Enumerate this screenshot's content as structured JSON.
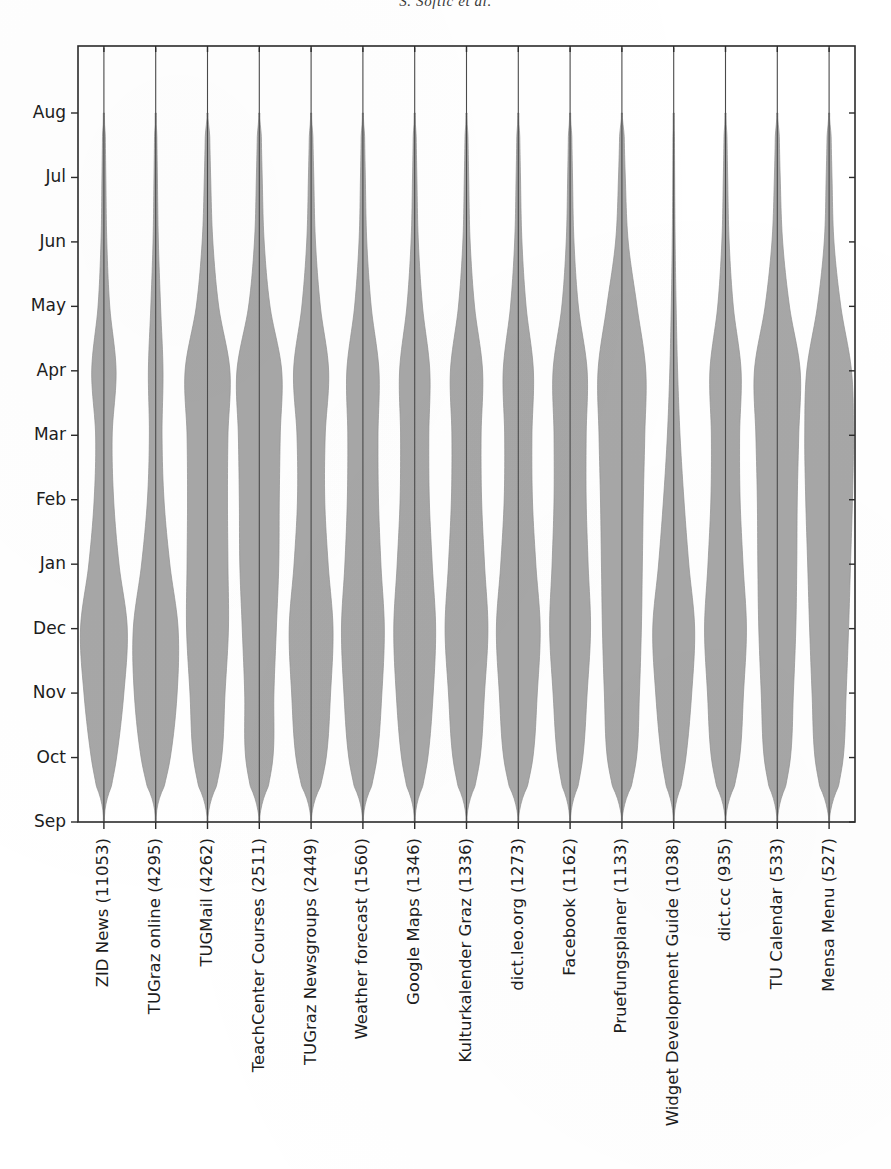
{
  "page": {
    "running_header": "S. Softic et al.",
    "folio": ""
  },
  "chart_data": {
    "type": "violin",
    "title": "",
    "xlabel": "",
    "ylabel": "",
    "orientation": "vertical",
    "grid": false,
    "legend": null,
    "y_axis": {
      "tick_labels": [
        "Aug",
        "Jul",
        "Jun",
        "May",
        "Apr",
        "Mar",
        "Feb",
        "Jan",
        "Dec",
        "Nov",
        "Oct",
        "Sep"
      ],
      "order": "top-to-bottom",
      "range_top": "Aug",
      "range_bottom": "Sep"
    },
    "categories": [
      "ZID News (11053)",
      "TUGraz online (4295)",
      "TUGMail (4262)",
      "TeachCenter Courses (2511)",
      "TUGraz Newsgroups (2449)",
      "Weather forecast (1560)",
      "Google Maps (1346)",
      "Kulturkalender Graz (1336)",
      "dict.leo.org (1273)",
      "Facebook (1162)",
      "Pruefungsplaner (1133)",
      "Widget Development Guide (1038)",
      "dict.cc (935)",
      "TU Calendar (533)",
      "Mensa Menu (527)"
    ],
    "counts": [
      11053,
      4295,
      4262,
      2511,
      2449,
      1560,
      1346,
      1336,
      1273,
      1162,
      1133,
      1038,
      935,
      533,
      527
    ],
    "series": [
      {
        "name": "ZID News (11053)",
        "count": 11053,
        "density_months": [
          "Sep",
          "Oct",
          "Nov",
          "Dec",
          "Jan",
          "Feb",
          "Mar",
          "Apr",
          "May",
          "Jun",
          "Jul",
          "Aug"
        ],
        "density": [
          0.07,
          0.52,
          0.82,
          0.96,
          0.62,
          0.4,
          0.34,
          0.5,
          0.24,
          0.12,
          0.08,
          0.05
        ]
      },
      {
        "name": "TUGraz online (4295)",
        "count": 4295,
        "density": [
          0.06,
          0.6,
          0.88,
          0.92,
          0.58,
          0.34,
          0.26,
          0.3,
          0.2,
          0.11,
          0.07,
          0.04
        ]
      },
      {
        "name": "TUGMail (4262)",
        "count": 4262,
        "density": [
          0.1,
          0.58,
          0.72,
          0.86,
          0.84,
          0.82,
          0.84,
          0.92,
          0.46,
          0.22,
          0.13,
          0.08
        ]
      },
      {
        "name": "TeachCenter Courses (2511)",
        "count": 2511,
        "density": [
          0.12,
          0.56,
          0.6,
          0.7,
          0.8,
          0.82,
          0.86,
          0.92,
          0.44,
          0.2,
          0.12,
          0.07
        ]
      },
      {
        "name": "TUGraz Newsgroups (2449)",
        "count": 2449,
        "density": [
          0.1,
          0.62,
          0.8,
          0.9,
          0.7,
          0.56,
          0.58,
          0.72,
          0.38,
          0.18,
          0.11,
          0.06
        ]
      },
      {
        "name": "Weather forecast (1560)",
        "count": 1560,
        "density": [
          0.09,
          0.58,
          0.78,
          0.88,
          0.74,
          0.64,
          0.62,
          0.66,
          0.34,
          0.16,
          0.1,
          0.06
        ]
      },
      {
        "name": "Google Maps (1346)",
        "count": 1346,
        "density": [
          0.08,
          0.54,
          0.76,
          0.86,
          0.72,
          0.6,
          0.58,
          0.62,
          0.32,
          0.15,
          0.09,
          0.05
        ]
      },
      {
        "name": "Kulturkalender Graz (1336)",
        "count": 1336,
        "density": [
          0.09,
          0.56,
          0.74,
          0.88,
          0.74,
          0.62,
          0.6,
          0.66,
          0.33,
          0.15,
          0.09,
          0.05
        ]
      },
      {
        "name": "dict.leo.org (1273)",
        "count": 1273,
        "density": [
          0.1,
          0.6,
          0.78,
          0.9,
          0.72,
          0.58,
          0.56,
          0.62,
          0.32,
          0.15,
          0.09,
          0.05
        ]
      },
      {
        "name": "Facebook (1162)",
        "count": 1162,
        "density": [
          0.09,
          0.52,
          0.7,
          0.84,
          0.74,
          0.66,
          0.66,
          0.7,
          0.34,
          0.16,
          0.1,
          0.06
        ]
      },
      {
        "name": "Pruefungsplaner (1133)",
        "count": 1133,
        "density": [
          0.12,
          0.6,
          0.72,
          0.8,
          0.84,
          0.88,
          0.94,
          0.98,
          0.62,
          0.26,
          0.14,
          0.08
        ]
      },
      {
        "name": "Widget Development Guide (1038)",
        "count": 1038,
        "density": [
          0.08,
          0.5,
          0.74,
          0.86,
          0.62,
          0.42,
          0.26,
          0.16,
          0.1,
          0.06,
          0.04,
          0.03
        ]
      },
      {
        "name": "dict.cc (935)",
        "count": 935,
        "density": [
          0.1,
          0.58,
          0.74,
          0.86,
          0.72,
          0.6,
          0.58,
          0.64,
          0.32,
          0.15,
          0.09,
          0.05
        ]
      },
      {
        "name": "TU Calendar (533)",
        "count": 533,
        "density": [
          0.1,
          0.54,
          0.66,
          0.76,
          0.8,
          0.82,
          0.88,
          0.94,
          0.5,
          0.22,
          0.12,
          0.07
        ]
      },
      {
        "name": "Mensa Menu (527)",
        "count": 527,
        "density": [
          0.14,
          0.58,
          0.7,
          0.8,
          0.88,
          0.96,
          1.0,
          0.92,
          0.48,
          0.2,
          0.12,
          0.07
        ]
      }
    ],
    "style": {
      "fill_color": "#a7a7a7",
      "line_color": "#4a4a4a",
      "axis_color": "#2b2b2b",
      "background": "#ffffff"
    }
  }
}
